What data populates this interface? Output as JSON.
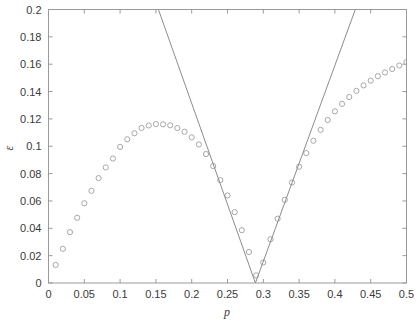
{
  "figure": {
    "background_color": "#ffffff",
    "axes_color": "#9a9a9a",
    "marker_color": "#a8a8a8",
    "line_color": "#8c8c8c",
    "text_color": "#3a3a3a"
  },
  "chart_data": {
    "type": "scatter",
    "title": "",
    "xlabel": "p",
    "ylabel": "ε",
    "xlim": [
      0,
      0.5
    ],
    "ylim": [
      0,
      0.2
    ],
    "grid": false,
    "legend": null,
    "xticks": [
      0,
      0.05,
      0.1,
      0.15,
      0.2,
      0.25,
      0.3,
      0.35,
      0.4,
      0.45,
      0.5
    ],
    "xticklabels": [
      "0",
      "0.05",
      "0.1",
      "0.15",
      "0.2",
      "0.25",
      "0.3",
      "0.35",
      "0.4",
      "0.45",
      "0.5"
    ],
    "yticks": [
      0,
      0.02,
      0.04,
      0.06,
      0.08,
      0.1,
      0.12,
      0.14,
      0.16,
      0.18,
      0.2
    ],
    "yticklabels": [
      "0",
      "0.02",
      "0.04",
      "0.06",
      "0.08",
      "0.1",
      "0.12",
      "0.14",
      "0.16",
      "0.18",
      "0.2"
    ],
    "xtick_minor_step": 0.05,
    "series": [
      {
        "name": "simulated-error",
        "style": "circle-markers",
        "marker": "o",
        "color": "#a8a8a8",
        "x": [
          0.01,
          0.02,
          0.03,
          0.04,
          0.05,
          0.06,
          0.07,
          0.08,
          0.09,
          0.1,
          0.11,
          0.12,
          0.13,
          0.14,
          0.15,
          0.16,
          0.17,
          0.18,
          0.19,
          0.2,
          0.21,
          0.22,
          0.23,
          0.24,
          0.25,
          0.26,
          0.27,
          0.28,
          0.29,
          0.3,
          0.31,
          0.32,
          0.33,
          0.34,
          0.35,
          0.36,
          0.37,
          0.38,
          0.39,
          0.4,
          0.41,
          0.42,
          0.43,
          0.44,
          0.45,
          0.46,
          0.47,
          0.48,
          0.49,
          0.5
        ],
        "y": [
          0.0132,
          0.025,
          0.0372,
          0.0477,
          0.0583,
          0.0674,
          0.0767,
          0.0845,
          0.091,
          0.0995,
          0.1051,
          0.1095,
          0.1134,
          0.1152,
          0.1162,
          0.116,
          0.1153,
          0.1133,
          0.1106,
          0.1065,
          0.1013,
          0.0943,
          0.0855,
          0.0752,
          0.064,
          0.0518,
          0.0386,
          0.0227,
          0.0056,
          0.015,
          0.032,
          0.047,
          0.0608,
          0.0735,
          0.085,
          0.095,
          0.104,
          0.112,
          0.1192,
          0.1255,
          0.131,
          0.136,
          0.1405,
          0.1445,
          0.148,
          0.1512,
          0.154,
          0.1565,
          0.159,
          0.1615
        ]
      },
      {
        "name": "theoretical-bound-left",
        "style": "solid-line",
        "color": "#8c8c8c",
        "x": [
          0.1535,
          0.289
        ],
        "y": [
          0.2,
          0.0
        ],
        "note": "descending straight line, clipped at top of axes"
      },
      {
        "name": "theoretical-bound-right",
        "style": "solid-line",
        "color": "#8c8c8c",
        "x": [
          0.289,
          0.4285
        ],
        "y": [
          0.0,
          0.2
        ],
        "note": "ascending straight line, clipped at top of axes"
      }
    ],
    "annotations": []
  }
}
